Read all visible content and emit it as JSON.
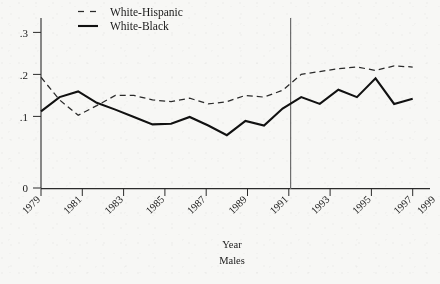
{
  "chart_data": {
    "type": "line",
    "title": "",
    "xlabel": "Year",
    "sublabel": "Males",
    "ylabel": "",
    "xlim": [
      1979,
      1999
    ],
    "ylim": [
      0,
      0.3
    ],
    "grid": false,
    "legend_position": "top-center",
    "x": [
      1979,
      1980,
      1981,
      1982,
      1983,
      1984,
      1985,
      1986,
      1987,
      1988,
      1989,
      1990,
      1991,
      1992,
      1993,
      1994,
      1995,
      1996,
      1997,
      1998,
      1999
    ],
    "xticklabels": [
      "1979",
      "1981",
      "1983",
      "1985",
      "1987",
      "1989",
      "1991",
      "1993",
      "1995",
      "1997",
      "1999"
    ],
    "yticklabels": [
      "0",
      ".1",
      ".2",
      ".3"
    ],
    "yticks": [
      0,
      0.1,
      0.2,
      0.3
    ],
    "annotations": [
      {
        "name": "vertical-reference-line",
        "x": 1992.4,
        "note": "vertical rule near 1992"
      }
    ],
    "series": [
      {
        "name": "White-Hispanic",
        "style": "dashed",
        "color": "#2a2a2a",
        "values": [
          0.195,
          0.155,
          0.128,
          0.145,
          0.163,
          0.163,
          0.155,
          0.152,
          0.158,
          0.148,
          0.152,
          0.163,
          0.16,
          0.172,
          0.2,
          0.205,
          0.21,
          0.213,
          0.207,
          0.215,
          0.213
        ]
      },
      {
        "name": "White-Black",
        "style": "solid",
        "color": "#111111",
        "values": [
          0.135,
          0.16,
          0.17,
          0.15,
          0.138,
          0.125,
          0.112,
          0.113,
          0.125,
          0.11,
          0.093,
          0.118,
          0.11,
          0.14,
          0.16,
          0.148,
          0.173,
          0.16,
          0.193,
          0.148,
          0.157
        ]
      }
    ]
  },
  "legend": {
    "items": [
      {
        "label": "White-Hispanic",
        "style": "dashed"
      },
      {
        "label": "White-Black",
        "style": "solid"
      }
    ]
  },
  "axis": {
    "x_title": "Year",
    "x_subtitle": "Males"
  }
}
